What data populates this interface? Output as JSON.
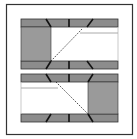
{
  "diagram": {
    "width": 137,
    "height": 139,
    "colors": {
      "background": "#ffffff",
      "frame_stroke": "#333333",
      "band_fill": "#8c8c8c",
      "block_fill": "#9a9a9a",
      "line_dark": "#111111",
      "guide_line": "#b0b0b0",
      "dashed_line": "#222222"
    },
    "frame": {
      "x": 6.5,
      "y": 4.5,
      "w": 126,
      "h": 130
    },
    "panels": [
      {
        "name": "top-panel",
        "band_top": {
          "x": 21,
          "y": 19,
          "w": 97,
          "h": 8
        },
        "band_bottom": {
          "x": 21,
          "y": 61,
          "w": 97,
          "h": 8
        },
        "block": {
          "x": 21,
          "y": 27,
          "w": 30,
          "h": 34,
          "side": "left"
        },
        "guide": {
          "x1": 80,
          "y1": 33,
          "x2": 118,
          "y2": 33
        },
        "dashed": {
          "x1": 51,
          "y1": 61,
          "x2": 80,
          "y2": 30
        }
      },
      {
        "name": "bottom-panel",
        "band_top": {
          "x": 21,
          "y": 74,
          "w": 97,
          "h": 8
        },
        "band_bottom": {
          "x": 21,
          "y": 114,
          "w": 97,
          "h": 8
        },
        "block": {
          "x": 88,
          "y": 82,
          "w": 30,
          "h": 32,
          "side": "right"
        },
        "guide": {
          "x1": 21,
          "y1": 88,
          "x2": 58,
          "y2": 88
        },
        "dashed": {
          "x1": 58,
          "y1": 84,
          "x2": 88,
          "y2": 114
        }
      }
    ]
  }
}
